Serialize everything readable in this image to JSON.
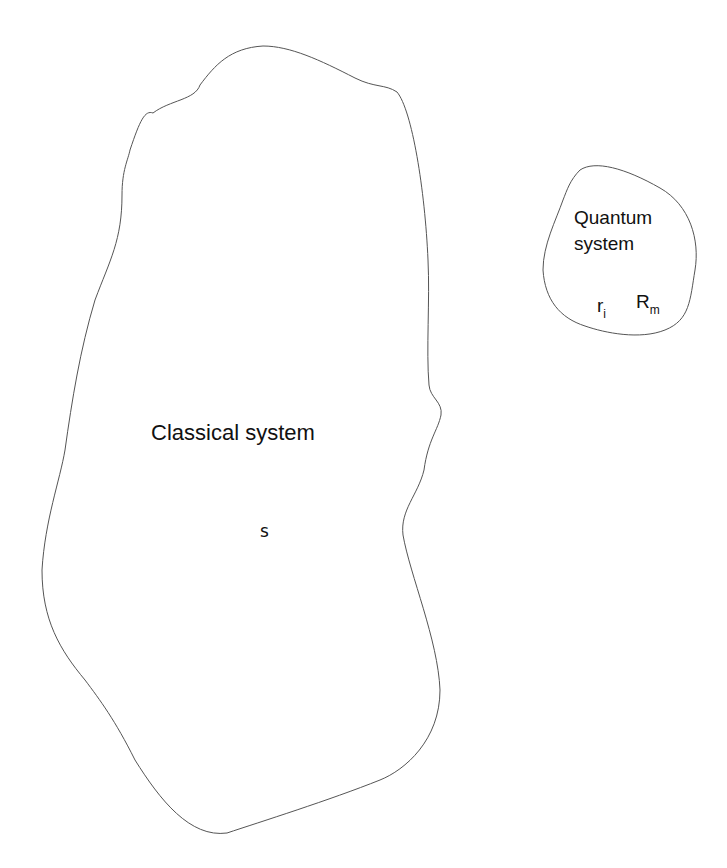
{
  "classical": {
    "label": "Classical system",
    "variable": "s"
  },
  "quantum": {
    "label_line1": "Quantum",
    "label_line2": "system",
    "var1_base": "r",
    "var1_sub": "i",
    "var2_base": "R",
    "var2_sub": "m"
  },
  "colors": {
    "outline": "#555555",
    "text": "#111111",
    "background": "#ffffff"
  }
}
